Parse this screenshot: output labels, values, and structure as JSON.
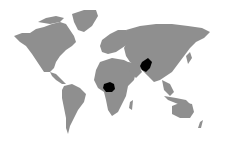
{
  "map": {
    "type": "world-map",
    "background_color": "#ffffff",
    "land_color": "#8f8f8f",
    "highlight_color": "#000000",
    "highlighted_regions": [
      {
        "name": "nigeria-region",
        "label": "Nigeria"
      },
      {
        "name": "pakistan-region",
        "label": "Pakistan"
      }
    ]
  }
}
